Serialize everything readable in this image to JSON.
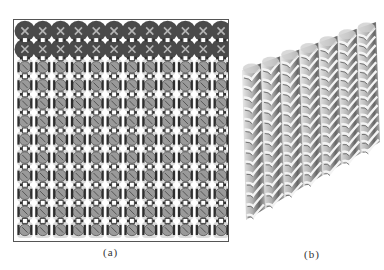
{
  "figure": {
    "panels": [
      {
        "id": "a",
        "caption": "(a)",
        "description": "top-view knitted lattice pattern",
        "grid": {
          "columns": 12,
          "rows": 12,
          "dark_header_rows": 2
        },
        "colors": {
          "header": "#4a4a4a",
          "bar": "#2e2e2e",
          "tile": "#9a9a9a",
          "node": "#ffffff",
          "frame": "#555555"
        }
      },
      {
        "id": "b",
        "caption": "(b)",
        "description": "3D perspective of knitted ribbed structure",
        "columns": 7,
        "colors": {
          "light": "#e8e8e8",
          "mid": "#a8a8a8",
          "dark": "#555555"
        }
      }
    ]
  }
}
